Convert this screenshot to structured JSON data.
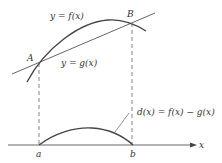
{
  "labels": {
    "f_curve": "y = f(x)",
    "g_line": "y = g(x)",
    "point_A": "A",
    "point_B": "B",
    "difference": "d(x) = f(x) − g(x)",
    "a": "a",
    "b": "b",
    "x_axis": "x"
  },
  "colors": {
    "stroke": "#444444",
    "text": "#333333"
  }
}
